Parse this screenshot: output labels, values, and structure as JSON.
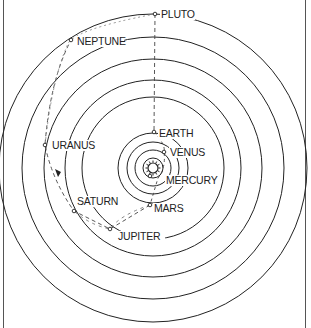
{
  "diagram": {
    "type": "solar-system-orbits",
    "center": {
      "x": 153,
      "y": 168
    },
    "colors": {
      "line": "#222222",
      "path": "#555555",
      "background": "#ffffff"
    },
    "sun": {
      "name": "sun-icon",
      "radius": 5
    },
    "planets": [
      {
        "name": "MERCURY",
        "radius": 10,
        "dot": [
          150,
          176
        ],
        "label_pos": [
          166,
          184
        ]
      },
      {
        "name": "VENUS",
        "radius": 18,
        "dot": [
          164,
          152
        ],
        "label_pos": [
          170,
          156
        ]
      },
      {
        "name": "EARTH",
        "radius": 36,
        "dot": [
          154,
          132
        ],
        "label_pos": [
          159,
          137
        ]
      },
      {
        "name": "MARS",
        "radius": 35,
        "dot": [
          150,
          205
        ],
        "label_pos": [
          154,
          212
        ]
      },
      {
        "name": "JUPITER",
        "radius": 71,
        "dot": [
          110,
          229
        ],
        "label_pos": [
          118,
          240
        ]
      },
      {
        "name": "SATURN",
        "radius": 88,
        "dot": [
          74,
          211
        ],
        "label_pos": [
          77,
          205
        ]
      },
      {
        "name": "URANUS",
        "radius": 109,
        "dot": [
          45,
          145
        ],
        "label_pos": [
          52,
          149
        ]
      },
      {
        "name": "NEPTUNE",
        "radius": 131,
        "dot": [
          71,
          40
        ],
        "label_pos": [
          77,
          45
        ]
      },
      {
        "name": "PLUTO",
        "radius": 154,
        "dot": [
          155,
          14
        ],
        "label_pos": [
          161,
          18
        ]
      }
    ],
    "ring_radii": [
      10,
      18,
      26,
      35,
      71,
      88,
      109,
      131,
      154
    ]
  }
}
